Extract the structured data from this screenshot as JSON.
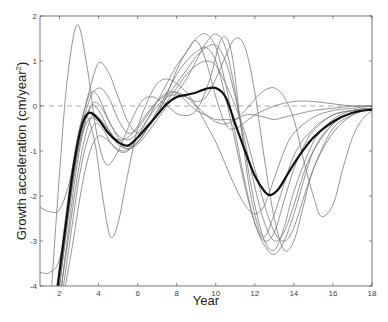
{
  "chart_data": {
    "type": "line",
    "title": "",
    "xlabel": "Year",
    "ylabel": "Growth acceleration (cm/year²)",
    "ylabel_parts": {
      "main": "Growth acceleration (cm/year",
      "sup": "2",
      "end": ")"
    },
    "xlim": [
      1,
      18
    ],
    "ylim": [
      -4,
      2
    ],
    "xticks": [
      2,
      4,
      6,
      8,
      10,
      12,
      14,
      16,
      18
    ],
    "yticks": [
      -4,
      -3,
      -2,
      -1,
      0,
      1,
      2
    ],
    "grid": false,
    "legend": null,
    "reference_line": {
      "y": 0,
      "style": "dashed",
      "color": "#aaaaaa"
    },
    "mean_curve": {
      "name": "mean",
      "style": "thick",
      "x": [
        1.9,
        2.3,
        2.7,
        3.1,
        3.5,
        4.0,
        4.5,
        5.0,
        5.5,
        6.0,
        6.5,
        7.0,
        7.5,
        8.0,
        8.5,
        9.0,
        9.5,
        10.0,
        10.5,
        11.0,
        11.5,
        12.0,
        12.5,
        12.8,
        13.2,
        13.7,
        14.2,
        15.0,
        16.0,
        17.0,
        18.0
      ],
      "y": [
        -4.0,
        -2.7,
        -1.4,
        -0.5,
        -0.15,
        -0.3,
        -0.6,
        -0.8,
        -0.88,
        -0.7,
        -0.45,
        -0.2,
        0.05,
        0.2,
        0.25,
        0.3,
        0.38,
        0.4,
        0.2,
        -0.4,
        -1.0,
        -1.55,
        -1.9,
        -1.98,
        -1.85,
        -1.5,
        -1.15,
        -0.7,
        -0.35,
        -0.15,
        -0.08
      ]
    },
    "series": [
      {
        "name": "curve-1",
        "x": [
          1.6,
          2.0,
          2.4,
          2.9,
          3.4,
          3.9,
          4.4,
          5.0,
          5.6,
          6.2,
          6.8,
          7.5,
          8.2,
          9.0,
          9.7,
          10.3,
          10.8,
          11.3,
          11.8,
          12.4,
          13.0,
          14.0,
          15.0,
          16.0,
          17.0,
          18.0
        ],
        "y": [
          -4.0,
          -1.5,
          0.6,
          1.8,
          0.9,
          -0.6,
          -1.3,
          -1.0,
          -0.4,
          0.1,
          0.2,
          0.0,
          -0.2,
          -0.1,
          0.6,
          1.5,
          1.2,
          -0.5,
          -2.0,
          -2.9,
          -2.4,
          -1.1,
          -0.5,
          -0.2,
          -0.1,
          -0.05
        ]
      },
      {
        "name": "curve-2",
        "x": [
          1.0,
          1.5,
          2.0,
          2.5,
          3.0,
          3.5,
          4.0,
          4.5,
          5.0,
          5.5,
          6.0,
          6.5,
          7.0,
          7.5,
          8.0,
          8.5,
          9.0,
          9.5,
          10.0,
          10.5,
          11.0,
          12.0,
          13.0,
          14.0,
          15.0,
          16.0,
          17.0,
          18.0
        ],
        "y": [
          -2.25,
          -2.35,
          -2.3,
          -1.7,
          -0.6,
          0.3,
          0.95,
          0.75,
          0.2,
          -0.35,
          -0.6,
          -0.5,
          -0.2,
          0.25,
          0.8,
          1.2,
          1.45,
          1.0,
          0.2,
          -0.4,
          -0.5,
          -0.2,
          0.0,
          0.1,
          0.1,
          0.05,
          0.0,
          0.0
        ]
      },
      {
        "name": "curve-3",
        "x": [
          1.0,
          1.5,
          2.0,
          2.5,
          3.0,
          3.5,
          4.0,
          4.5,
          5.0,
          5.5,
          6.0,
          6.5,
          7.0,
          7.5,
          8.0,
          8.5,
          9.0,
          9.5,
          10.0,
          10.5,
          11.0,
          11.5,
          12.0,
          12.5,
          13.0,
          13.5,
          14.0,
          15.0,
          16.0,
          17.0,
          18.0
        ],
        "y": [
          -3.7,
          -3.7,
          -3.4,
          -2.2,
          -0.8,
          0.1,
          0.4,
          0.2,
          -0.3,
          -0.6,
          -0.5,
          -0.2,
          0.1,
          0.3,
          0.3,
          0.1,
          -0.1,
          -0.2,
          -0.3,
          -0.3,
          -0.3,
          -0.2,
          -0.2,
          -0.25,
          -0.3,
          -0.25,
          -0.2,
          -0.1,
          -0.05,
          0.0,
          0.0
        ]
      },
      {
        "name": "curve-4",
        "x": [
          1.9,
          2.3,
          2.8,
          3.3,
          3.8,
          4.2,
          4.6,
          5.0,
          5.5,
          6.0,
          6.5,
          7.0,
          7.5,
          8.0,
          8.5,
          9.0,
          9.5,
          10.0,
          10.5,
          11.0,
          11.5,
          12.0,
          12.5,
          13.0,
          13.5,
          14.0,
          15.0,
          16.0,
          17.0,
          18.0
        ],
        "y": [
          -4.0,
          -2.5,
          -1.0,
          -0.2,
          -0.8,
          -2.0,
          -2.9,
          -2.6,
          -1.5,
          -0.5,
          0.1,
          0.5,
          0.6,
          0.5,
          0.3,
          0.0,
          -0.4,
          -0.8,
          -1.3,
          -1.8,
          -2.2,
          -2.4,
          -2.2,
          -1.6,
          -1.0,
          -0.6,
          -0.25,
          -0.1,
          -0.05,
          0.0
        ]
      },
      {
        "name": "curve-5",
        "x": [
          2.0,
          2.4,
          2.8,
          3.2,
          3.6,
          4.0,
          4.5,
          5.0,
          5.5,
          6.0,
          6.5,
          7.0,
          7.5,
          8.0,
          8.5,
          9.0,
          9.5,
          10.0,
          10.5,
          11.0,
          11.5,
          12.0,
          12.5,
          13.0,
          13.5,
          14.0,
          14.5,
          15.0,
          16.0,
          17.0,
          18.0
        ],
        "y": [
          -4.0,
          -2.4,
          -1.0,
          -0.2,
          0.3,
          0.2,
          -0.3,
          -0.7,
          -0.9,
          -0.8,
          -0.5,
          -0.1,
          0.3,
          0.7,
          1.0,
          1.2,
          1.3,
          1.0,
          0.2,
          -0.8,
          -1.8,
          -2.6,
          -3.0,
          -2.8,
          -2.1,
          -1.4,
          -0.9,
          -0.55,
          -0.2,
          -0.1,
          -0.05
        ]
      },
      {
        "name": "curve-6",
        "x": [
          2.0,
          2.4,
          2.8,
          3.2,
          3.6,
          4.0,
          4.5,
          5.0,
          5.5,
          6.0,
          6.5,
          7.0,
          7.5,
          8.0,
          8.5,
          9.0,
          9.5,
          10.0,
          10.5,
          11.0,
          11.5,
          12.0,
          12.5,
          13.0,
          13.5,
          14.0,
          15.0,
          16.0,
          17.0,
          18.0
        ],
        "y": [
          -4.0,
          -2.6,
          -1.3,
          -0.5,
          0.0,
          -0.1,
          -0.5,
          -0.8,
          -0.95,
          -0.85,
          -0.6,
          -0.3,
          0.0,
          0.3,
          0.6,
          1.0,
          1.4,
          1.6,
          1.3,
          0.3,
          -1.0,
          -2.2,
          -3.0,
          -3.2,
          -2.7,
          -1.9,
          -0.8,
          -0.3,
          -0.1,
          -0.05
        ]
      },
      {
        "name": "curve-7",
        "x": [
          2.1,
          2.5,
          2.9,
          3.3,
          3.7,
          4.1,
          4.6,
          5.0,
          5.5,
          6.0,
          6.5,
          7.0,
          7.5,
          8.0,
          8.5,
          9.0,
          9.5,
          10.0,
          10.5,
          11.0,
          11.5,
          12.0,
          12.5,
          13.0,
          13.5,
          14.0,
          14.5,
          15.0,
          16.0,
          17.0,
          18.0
        ],
        "y": [
          -4.0,
          -2.6,
          -1.3,
          -0.4,
          0.05,
          0.0,
          -0.4,
          -0.65,
          -0.75,
          -0.6,
          -0.3,
          0.0,
          0.2,
          0.25,
          0.2,
          0.1,
          0.2,
          0.6,
          1.1,
          1.5,
          1.3,
          0.3,
          -1.2,
          -2.5,
          -3.2,
          -3.0,
          -2.2,
          -1.4,
          -0.5,
          -0.2,
          -0.05
        ]
      },
      {
        "name": "curve-8",
        "x": [
          2.1,
          2.5,
          2.9,
          3.3,
          3.7,
          4.1,
          4.6,
          5.0,
          5.5,
          6.0,
          6.5,
          7.0,
          7.5,
          8.0,
          8.5,
          9.0,
          9.5,
          10.0,
          10.5,
          11.0,
          11.5,
          12.0,
          12.5,
          13.0,
          13.5,
          14.0,
          14.5,
          15.0,
          16.0,
          17.0,
          18.0
        ],
        "y": [
          -4.0,
          -2.8,
          -1.6,
          -0.7,
          -0.2,
          -0.3,
          -0.6,
          -0.85,
          -0.95,
          -0.8,
          -0.5,
          -0.15,
          0.2,
          0.5,
          0.8,
          1.1,
          1.3,
          1.35,
          1.0,
          0.2,
          -0.8,
          -1.8,
          -2.6,
          -3.0,
          -2.8,
          -2.2,
          -1.5,
          -1.0,
          -0.4,
          -0.15,
          -0.05
        ]
      },
      {
        "name": "curve-9",
        "x": [
          2.2,
          2.6,
          3.0,
          3.4,
          3.8,
          4.2,
          4.6,
          5.0,
          5.5,
          6.0,
          6.5,
          7.0,
          7.5,
          8.0,
          8.5,
          9.0,
          9.5,
          10.0,
          10.5,
          11.0,
          11.5,
          12.0,
          12.5,
          13.0,
          13.5,
          14.0,
          15.0,
          16.0,
          17.0,
          18.0
        ],
        "y": [
          -4.0,
          -2.8,
          -1.6,
          -0.8,
          -0.4,
          -0.5,
          -0.8,
          -1.0,
          -1.0,
          -0.7,
          -0.3,
          0.1,
          0.5,
          0.9,
          1.2,
          1.5,
          1.6,
          1.3,
          0.5,
          -0.6,
          -1.7,
          -2.6,
          -3.1,
          -3.3,
          -3.0,
          -2.4,
          -1.0,
          -0.4,
          -0.15,
          -0.05
        ]
      },
      {
        "name": "curve-10",
        "x": [
          2.3,
          2.7,
          3.1,
          3.5,
          3.9,
          4.3,
          4.8,
          5.2,
          5.6,
          6.0,
          6.5,
          7.0,
          7.5,
          8.0,
          8.5,
          9.0,
          9.5,
          10.0,
          10.5,
          11.0,
          11.5,
          12.0,
          12.5,
          13.0,
          13.5,
          14.0,
          15.0,
          16.0,
          17.0,
          18.0
        ],
        "y": [
          -4.0,
          -3.0,
          -1.9,
          -1.1,
          -0.7,
          -0.7,
          -0.9,
          -1.0,
          -0.95,
          -0.8,
          -0.5,
          -0.2,
          0.1,
          0.4,
          0.7,
          0.9,
          1.0,
          0.9,
          0.5,
          0.0,
          -0.6,
          -1.4,
          -2.2,
          -2.8,
          -3.0,
          -2.7,
          -1.4,
          -0.6,
          -0.2,
          -0.05
        ]
      },
      {
        "name": "curve-11",
        "x": [
          2.0,
          2.5,
          3.0,
          3.5,
          4.0,
          4.5,
          5.0,
          5.5,
          6.0,
          6.5,
          7.0,
          7.5,
          8.0,
          8.5,
          9.0,
          9.5,
          10.0,
          10.5,
          11.0,
          11.5,
          12.0,
          12.5,
          13.0,
          13.5,
          14.0,
          14.5,
          15.0,
          15.4,
          16.0,
          16.5,
          17.0,
          17.5,
          18.0
        ],
        "y": [
          -4.0,
          -2.3,
          -0.9,
          -0.3,
          -0.35,
          -0.6,
          -0.75,
          -0.7,
          -0.45,
          -0.15,
          0.1,
          0.25,
          0.3,
          0.2,
          0.0,
          -0.2,
          -0.35,
          -0.4,
          -0.3,
          -0.1,
          0.15,
          0.35,
          0.4,
          0.2,
          -0.3,
          -1.2,
          -2.0,
          -2.45,
          -2.2,
          -1.4,
          -0.7,
          -0.3,
          -0.1
        ]
      }
    ]
  }
}
